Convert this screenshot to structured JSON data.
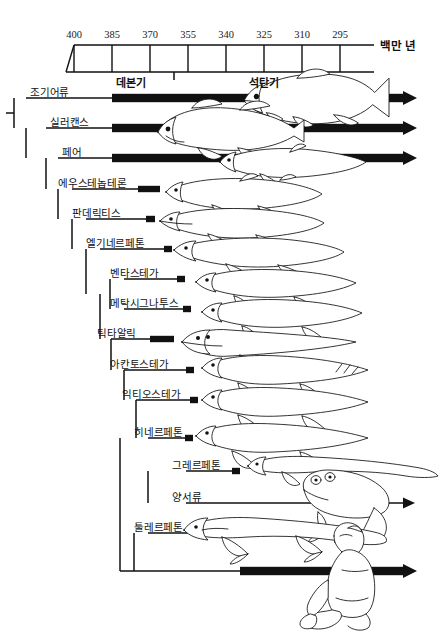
{
  "figure": {
    "type": "phylogenetic-timeline-cladogram",
    "unit_label": "백만 년",
    "axis": {
      "ticks": [
        400,
        385,
        370,
        355,
        340,
        325,
        310,
        295
      ],
      "tick_x": [
        74,
        112,
        150,
        188,
        226,
        264,
        302,
        340
      ],
      "box_left": 66,
      "box_right": 370,
      "line_right": 374,
      "top_y": 45,
      "bottom_y": 72
    },
    "periods": [
      {
        "name": "데본기",
        "x": 131,
        "y": 74
      },
      {
        "name": "석탄기",
        "x": 264,
        "y": 74
      }
    ],
    "period_divider_x": 174
  },
  "taxa": [
    {
      "label": "조기어류",
      "label_x": 30,
      "y": 98,
      "stem_x": 26,
      "bar_start": 112,
      "bar_kind": "thick-extant",
      "arrow_end": 403,
      "art": "trout"
    },
    {
      "label": "실러캔스",
      "label_x": 50,
      "y": 128,
      "stem_x": 46,
      "bar_start": 112,
      "bar_kind": "thick-extant",
      "arrow_end": 403,
      "art": "coelacanth"
    },
    {
      "label": "페어",
      "label_x": 62,
      "y": 158,
      "stem_x": 58,
      "bar_start": 112,
      "bar_kind": "thick-extant",
      "arrow_end": 403,
      "art": "lungfish"
    },
    {
      "label": "에우스테놉테론",
      "label_x": 58,
      "y": 189,
      "stem_x": 72,
      "bar_start": 138,
      "bar_kind": "range",
      "range_end": 160,
      "art": "eusthenopteron"
    },
    {
      "label": "판데릭티스",
      "label_x": 72,
      "y": 219,
      "stem_x": 86,
      "bar_start": 146,
      "bar_kind": "range",
      "range_end": 155,
      "art": "panderichthys"
    },
    {
      "label": "엘기네르페톤",
      "label_x": 86,
      "y": 249,
      "stem_x": 100,
      "bar_start": 164,
      "bar_kind": "range",
      "range_end": 172,
      "art": "elginerpeton"
    },
    {
      "label": "벤타스테가",
      "label_x": 110,
      "y": 279,
      "stem_x": 124,
      "bar_start": 177,
      "bar_kind": "range",
      "range_end": 185,
      "art": "ventastega"
    },
    {
      "label": "메탁시그나투스",
      "label_x": 110,
      "y": 309,
      "stem_x": 124,
      "bar_start": 183,
      "bar_kind": "range",
      "range_end": 191,
      "art": "metaxygnathus"
    },
    {
      "label": "틱타알릭",
      "label_x": 97,
      "y": 339,
      "stem_x": 111,
      "bar_start": 150,
      "bar_kind": "range",
      "range_end": 174,
      "art": "tiktaalik"
    },
    {
      "label": "아칸토스테가",
      "label_x": 110,
      "y": 370,
      "stem_x": 124,
      "bar_start": 186,
      "bar_kind": "range",
      "range_end": 194,
      "art": "acanthostega"
    },
    {
      "label": "익티오스테가",
      "label_x": 122,
      "y": 400,
      "stem_x": 136,
      "bar_start": 190,
      "bar_kind": "range",
      "range_end": 198,
      "art": "ichthyostega"
    },
    {
      "label": "히네르페톤",
      "label_x": 134,
      "y": 438,
      "stem_x": 148,
      "bar_start": 185,
      "bar_kind": "range",
      "range_end": 193,
      "art": "hynerpeton"
    },
    {
      "label": "그레르페톤",
      "label_x": 172,
      "y": 471,
      "stem_x": 186,
      "bar_start": 232,
      "bar_kind": "range",
      "range_end": 240,
      "art": "greererpeton"
    },
    {
      "label": "양서류",
      "label_x": 172,
      "y": 503,
      "stem_x": 186,
      "bar_start": 232,
      "bar_kind": "thin-extant",
      "arrow_end": 403,
      "art": "frog"
    },
    {
      "label": "툴레르페톤",
      "label_x": 134,
      "y": 533,
      "stem_x": 148,
      "bar_start": 203,
      "bar_kind": "range",
      "range_end": 211,
      "art": "tulerpeton"
    },
    {
      "label": "",
      "label_x": 0,
      "y": 571,
      "stem_x": 120,
      "bar_start": 240,
      "bar_kind": "thick-extant",
      "arrow_end": 403,
      "art": "human"
    }
  ],
  "nodes": [
    {
      "name": "root",
      "x": 14,
      "y_top": 98,
      "y_bottom": 128
    },
    {
      "name": "sarcopt",
      "x": 26,
      "y_top": 128,
      "y_bottom": 158
    },
    {
      "name": "rhipidist",
      "x": 46,
      "y_top": 158,
      "y_bottom": 189
    },
    {
      "name": "tetrapodo",
      "x": 58,
      "y_top": 189,
      "y_bottom": 219
    },
    {
      "name": "elpisto",
      "x": 72,
      "y_top": 219,
      "y_bottom": 249
    },
    {
      "name": "stego",
      "x": 86,
      "y_top": 249,
      "y_bottom": 294
    },
    {
      "name": "ventnode",
      "x": 110,
      "y_top": 279,
      "y_bottom": 309
    },
    {
      "name": "tiktnode",
      "x": 100,
      "y_top": 294,
      "y_bottom": 339
    },
    {
      "name": "acanthnode",
      "x": 111,
      "y_top": 339,
      "y_bottom": 370
    },
    {
      "name": "ichthynode",
      "x": 124,
      "y_top": 370,
      "y_bottom": 400
    },
    {
      "name": "hynernode",
      "x": 136,
      "y_top": 400,
      "y_bottom": 438
    },
    {
      "name": "crownnode",
      "x": 120,
      "y_top": 438,
      "y_bottom": 571
    },
    {
      "name": "amphnode",
      "x": 148,
      "y_top": 471,
      "y_bottom": 503
    },
    {
      "name": "tulnode",
      "x": 134,
      "y_top": 533,
      "y_bottom": 571
    }
  ],
  "colors": {
    "ink": "#111111",
    "bar": "#111111",
    "background": "#ffffff"
  }
}
